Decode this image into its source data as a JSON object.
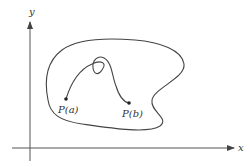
{
  "diagram": {
    "axes": {
      "x_label": "x",
      "y_label": "y"
    },
    "region": {
      "description": "closed region containing the curve"
    },
    "curve": {
      "start_label": "P(a)",
      "end_label": "P(b)",
      "description": "parametric curve with a loop from P(a) to P(b)"
    },
    "colors": {
      "stroke": "#444444",
      "axis": "#555555",
      "text": "#333333"
    }
  }
}
